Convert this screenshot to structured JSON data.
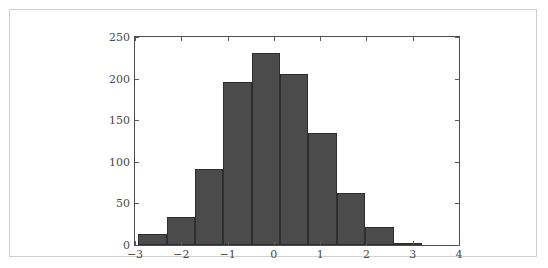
{
  "figure": {
    "background_color": "#ffffff",
    "border_color": "#cfcfcf",
    "axes_color": "#4d4d4d",
    "tick_label_color": "#4a4a4a"
  },
  "chart_data": {
    "type": "bar",
    "chart_subtype": "histogram",
    "title": "",
    "subtitle": "",
    "xlabel": "",
    "ylabel": "",
    "xlim": [
      -3,
      4
    ],
    "ylim": [
      0,
      250
    ],
    "grid": false,
    "legend": null,
    "bar_color": "#4b4b4b",
    "bar_edge_color": "#2e2e2e",
    "bin_edges": [
      -2.93,
      -2.317,
      -1.704,
      -1.091,
      -0.478,
      0.135,
      0.748,
      1.361,
      1.974,
      2.587,
      3.2
    ],
    "bin_width": 0.613,
    "bin_centers": [
      -2.624,
      -2.011,
      -1.398,
      -0.785,
      -0.172,
      0.441,
      1.054,
      1.667,
      2.28,
      2.893
    ],
    "categories": [
      "-2.93 to -2.32",
      "-2.32 to -1.70",
      "-1.70 to -1.09",
      "-1.09 to -0.48",
      "-0.48 to 0.14",
      "0.14 to 0.75",
      "0.75 to 1.36",
      "1.36 to 1.97",
      "1.97 to 2.59",
      "2.59 to 3.20"
    ],
    "values": [
      13,
      34,
      91,
      196,
      231,
      205,
      135,
      63,
      22,
      2
    ],
    "total_count": 992,
    "x_ticks": [
      -3,
      -2,
      -1,
      0,
      1,
      2,
      3,
      4
    ],
    "x_tick_labels": [
      "−3",
      "−2",
      "−1",
      "0",
      "1",
      "2",
      "3",
      "4"
    ],
    "y_ticks": [
      0,
      50,
      100,
      150,
      200,
      250
    ],
    "y_tick_labels": [
      "0",
      "50",
      "100",
      "150",
      "200",
      "250"
    ]
  }
}
